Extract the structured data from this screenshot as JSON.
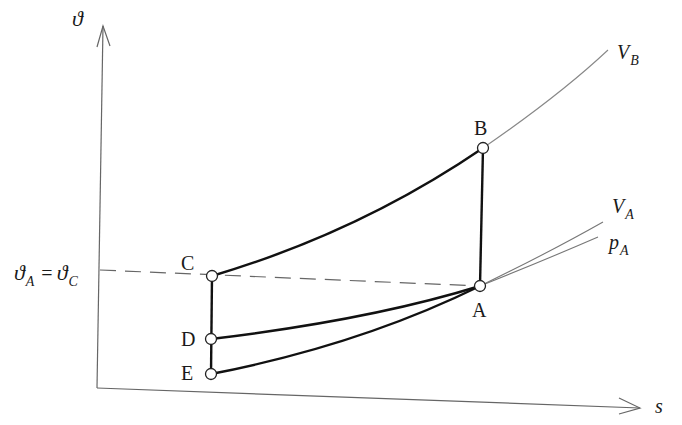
{
  "diagram": {
    "type": "T-s diagram",
    "axes": {
      "y_label": "ϑ",
      "x_label": "s"
    },
    "reference_line": {
      "label_left": "ϑ",
      "label_left_sub": "A",
      "equals": "=",
      "label_right": "ϑ",
      "label_right_sub": "C"
    },
    "points": [
      {
        "id": "A",
        "label": "A"
      },
      {
        "id": "B",
        "label": "B"
      },
      {
        "id": "C",
        "label": "C"
      },
      {
        "id": "D",
        "label": "D"
      },
      {
        "id": "E",
        "label": "E"
      }
    ],
    "curves": {
      "VB": {
        "main": "V",
        "sub": "B"
      },
      "VA": {
        "main": "V",
        "sub": "A"
      },
      "pA": {
        "main": "p",
        "sub": "A"
      }
    },
    "colors": {
      "process_line": "#111111",
      "thin_line": "#777777",
      "dashed_line": "#555555",
      "axis": "#666666"
    }
  }
}
